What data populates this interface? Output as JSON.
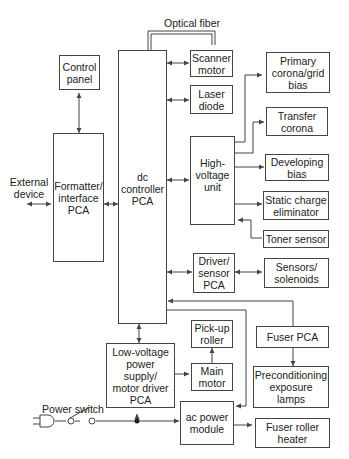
{
  "diagram": {
    "type": "block-diagram",
    "labels": {
      "optical_fiber": "Optical fiber",
      "external_device": "External\ndevice",
      "power_switch": "Power switch"
    },
    "blocks": {
      "control_panel": "Control\npanel",
      "formatter": "Formatter/\ninterface\nPCA",
      "dc_controller": "dc\ncontroller\nPCA",
      "scanner_motor": "Scanner\nmotor",
      "laser_diode": "Laser\ndiode",
      "high_voltage": "High-\nvoltage\nunit",
      "primary_corona": "Primary\ncorona/grid\nbias",
      "transfer_corona": "Transfer\ncorona",
      "developing_bias": "Developing\nbias",
      "static_charge": "Static charge\neliminator",
      "toner_sensor": "Toner sensor",
      "driver_sensor": "Driver/\nsensor\nPCA",
      "sensors_solenoids": "Sensors/\nsolenoids",
      "fuser_pca": "Fuser PCA",
      "preconditioning": "Preconditioning\nexposure\nlamps",
      "pickup_roller": "Pick-up\nroller",
      "main_motor": "Main\nmotor",
      "low_voltage": "Low-voltage\npower\nsupply/\nmotor driver\nPCA",
      "ac_power": "ac power\nmodule",
      "fuser_heater": "Fuser roller\nheater"
    },
    "colors": {
      "line": "#444444",
      "background": "#ffffff",
      "text": "#222222"
    }
  }
}
